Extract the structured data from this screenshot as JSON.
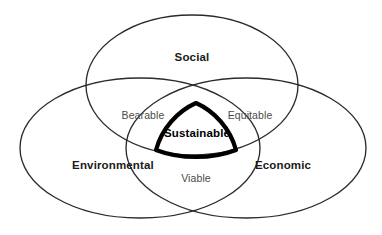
{
  "diagram": {
    "type": "venn",
    "set_count": 3,
    "background_color": "#ffffff",
    "outline_color": "#2b2b2b",
    "core_outline_color": "#000000",
    "sets": [
      {
        "id": "social",
        "label": "Social",
        "position": "top",
        "center": [
          192,
          85
        ],
        "radius_x": 106,
        "radius_y": 70,
        "label_point": [
          192,
          57
        ]
      },
      {
        "id": "environmental",
        "label": "Environmental",
        "position": "bottom-left",
        "center": [
          140,
          148
        ],
        "radius_x": 120,
        "radius_y": 70,
        "label_point": [
          113,
          165
        ]
      },
      {
        "id": "economic",
        "label": "Economic",
        "position": "bottom-right",
        "center": [
          246,
          148
        ],
        "radius_x": 120,
        "radius_y": 70,
        "label_point": [
          283,
          165
        ]
      }
    ],
    "pairwise_intersections": [
      {
        "id": "bearable",
        "label": "Bearable",
        "sets": [
          "social",
          "environmental"
        ],
        "label_point": [
          143,
          116
        ]
      },
      {
        "id": "equitable",
        "label": "Equitable",
        "sets": [
          "social",
          "economic"
        ],
        "label_point": [
          250,
          116
        ]
      },
      {
        "id": "viable",
        "label": "Viable",
        "sets": [
          "environmental",
          "economic"
        ],
        "label_point": [
          196,
          179
        ]
      }
    ],
    "core_intersection": {
      "id": "sustainable",
      "label": "Sustainable",
      "sets": [
        "social",
        "environmental",
        "economic"
      ],
      "label_point": [
        197,
        133
      ],
      "emphasis": "bold-thick-outline"
    }
  }
}
